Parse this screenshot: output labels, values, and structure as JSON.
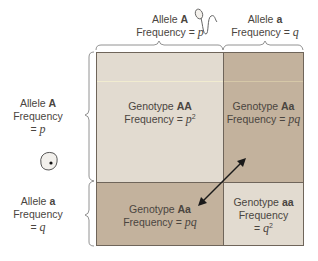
{
  "top_labels": {
    "allele_A": {
      "title": "Allele",
      "allele": "A",
      "freq_label": "Frequency =",
      "freq_var": "p"
    },
    "allele_a": {
      "title": "Allele",
      "allele": "a",
      "freq_label": "Frequency =",
      "freq_var": "q"
    }
  },
  "left_labels": {
    "allele_A": {
      "title": "Allele",
      "allele": "A",
      "freq_label": "Frequency",
      "eq": "=",
      "freq_var": "p"
    },
    "allele_a": {
      "title": "Allele",
      "allele": "a",
      "freq_label": "Frequency",
      "eq": "=",
      "freq_var": "q"
    }
  },
  "cells": {
    "AA": {
      "genotype_label": "Genotype",
      "genotype": "AA",
      "freq_label": "Frequency =",
      "freq_var": "p",
      "freq_exp": "2",
      "color": "#e2dbd0"
    },
    "Aa_top": {
      "genotype_label": "Genotype",
      "genotype": "Aa",
      "freq_label": "Frequency =",
      "freq_var": "pq",
      "color": "#c3b29d"
    },
    "Aa_bottom": {
      "genotype_label": "Genotype",
      "genotype": "Aa",
      "freq_label": "Frequency =",
      "freq_var": "pq",
      "color": "#c3b29d"
    },
    "aa": {
      "genotype_label": "Genotype",
      "genotype": "aa",
      "freq_label": "Frequency",
      "eq": "=",
      "freq_var": "q",
      "freq_exp": "2",
      "color": "#e2dbd0"
    }
  },
  "icons": {
    "sperm": "sperm-icon",
    "egg": "egg-icon",
    "arrow": "double-arrow-icon"
  }
}
